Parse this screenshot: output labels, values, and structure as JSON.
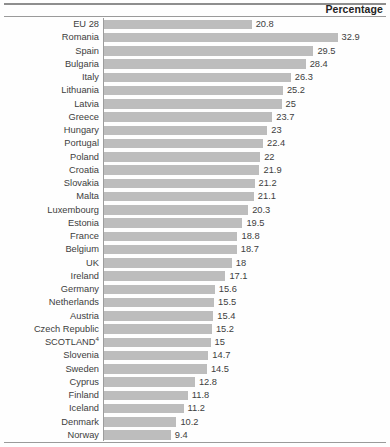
{
  "header": {
    "title": "Percentage"
  },
  "chart_data": {
    "type": "bar",
    "orientation": "horizontal",
    "title": "",
    "subtitle": "",
    "xlabel": "Percentage",
    "ylabel": "",
    "xlim": [
      0,
      32.9
    ],
    "grid": false,
    "legend": null,
    "bar_color": "#bdbdbd",
    "categories": [
      "EU 28",
      "Romania",
      "Spain",
      "Bulgaria",
      "Italy",
      "Lithuania",
      "Latvia",
      "Greece",
      "Hungary",
      "Portugal",
      "Poland",
      "Croatia",
      "Slovakia",
      "Malta",
      "Luxembourg",
      "Estonia",
      "France",
      "Belgium",
      "UK",
      "Ireland",
      "Germany",
      "Netherlands",
      "Austria",
      "Czech Republic",
      "SCOTLAND",
      "Slovenia",
      "Sweden",
      "Cyprus",
      "Finland",
      "Iceland",
      "Denmark",
      "Norway"
    ],
    "values": [
      20.8,
      32.9,
      29.5,
      28.4,
      26.3,
      25.2,
      25,
      23.7,
      23,
      22.4,
      22,
      21.9,
      21.2,
      21.1,
      20.3,
      19.5,
      18.8,
      18.7,
      18,
      17.1,
      15.6,
      15.5,
      15.4,
      15.2,
      15,
      14.7,
      14.5,
      12.8,
      11.8,
      11.2,
      10.2,
      9.4
    ],
    "value_labels": [
      "20.8",
      "32.9",
      "29.5",
      "28.4",
      "26.3",
      "25.2",
      "25",
      "23.7",
      "23",
      "22.4",
      "22",
      "21.9",
      "21.2",
      "21.1",
      "20.3",
      "19.5",
      "18.8",
      "18.7",
      "18",
      "17.1",
      "15.6",
      "15.5",
      "15.4",
      "15.2",
      "15",
      "14.7",
      "14.5",
      "12.8",
      "11.8",
      "11.2",
      "10.2",
      "9.4"
    ],
    "annotations": [
      {
        "category": "SCOTLAND",
        "superscript": "4"
      }
    ]
  }
}
